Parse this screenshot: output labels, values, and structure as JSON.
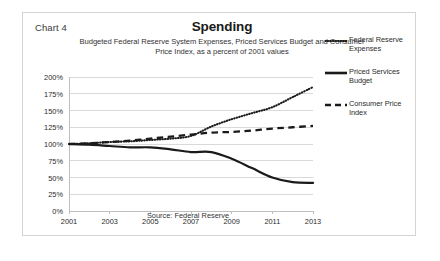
{
  "chart_number_label": "Chart 4",
  "header": {
    "title": "Spending",
    "subtitle_line1": "Budgeted Federal Reserve System Expenses, Priced Services Budget and Consumer",
    "subtitle_line2": "Price Index, as a percent of 2001 values"
  },
  "source_note": "Source: Federal Reserve",
  "legend": {
    "items": [
      {
        "label_line1": "Federal Reserve",
        "label_line2": "Expenses",
        "style": "dotted",
        "swatch_name": "legend-swatch-dotted"
      },
      {
        "label_line1": "Priced Services",
        "label_line2": "Budget",
        "style": "solid",
        "swatch_name": "legend-swatch-solid"
      },
      {
        "label_line1": "Consumer Price",
        "label_line2": "Index",
        "style": "dashed",
        "swatch_name": "legend-swatch-dashed"
      }
    ]
  },
  "colors": {
    "series": "#1a1a1a",
    "gridline": "#d9d9d9",
    "axis": "#bfbfbf",
    "text": "#2b2b2b",
    "frame": "#d4d4d4"
  },
  "chart_data": {
    "type": "line",
    "title": "Spending",
    "subtitle": "Budgeted Federal Reserve System Expenses, Priced Services Budget and Consumer Price Index, as a percent of 2001 values",
    "xlabel": "",
    "ylabel": "",
    "grid": true,
    "legend_position": "right",
    "xlim": [
      2001,
      2013
    ],
    "ylim": [
      0,
      200
    ],
    "ytick_values": [
      0,
      25,
      50,
      75,
      100,
      125,
      150,
      175,
      200
    ],
    "ytick_labels": [
      "0%",
      "25%",
      "50%",
      "75%",
      "100%",
      "125%",
      "150%",
      "175%",
      "200%"
    ],
    "xtick_values": [
      2001,
      2003,
      2005,
      2007,
      2009,
      2011,
      2013
    ],
    "xtick_labels": [
      "2001",
      "2003",
      "2005",
      "2007",
      "2009",
      "2011",
      "2013"
    ],
    "x": [
      2001,
      2002,
      2003,
      2004,
      2005,
      2006,
      2007,
      2008,
      2009,
      2010,
      2011,
      2012,
      2013
    ],
    "series": [
      {
        "name": "Federal Reserve Expenses",
        "linestyle": "dotted",
        "values": [
          100,
          101,
          103,
          104,
          106,
          108,
          112,
          126,
          137,
          146,
          155,
          170,
          185
        ]
      },
      {
        "name": "Priced Services Budget",
        "linestyle": "solid",
        "values": [
          100,
          99,
          97,
          95,
          95,
          92,
          88,
          88,
          78,
          64,
          50,
          43,
          42
        ]
      },
      {
        "name": "Consumer Price Index",
        "linestyle": "dashed",
        "values": [
          100,
          101,
          103,
          105,
          108,
          111,
          114,
          117,
          118,
          120,
          123,
          125,
          127
        ]
      }
    ]
  }
}
